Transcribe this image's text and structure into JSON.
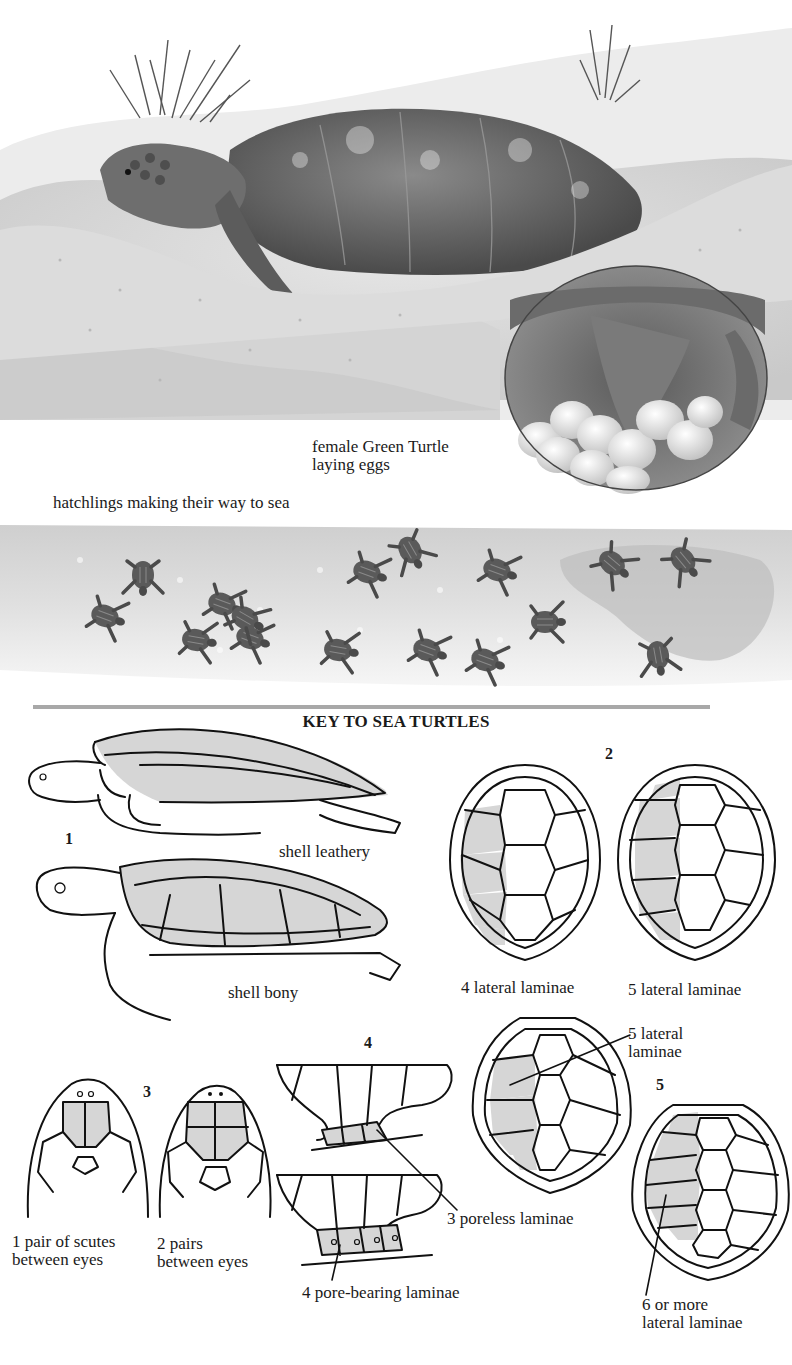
{
  "illustration_top": {
    "subject": "female Green Turtle nesting on sandy dune",
    "inset": "circular inset showing eggs being laid",
    "caption_line1": "female Green Turtle",
    "caption_line2": "laying eggs"
  },
  "illustration_hatchlings": {
    "caption": "hatchlings making their way to sea",
    "hatchling_count": 16
  },
  "divider": {
    "color": "#a8a8a8"
  },
  "key": {
    "title": "KEY TO SEA TURTLES",
    "accent_shade": "#d6d6d6",
    "sections": [
      {
        "number": "1",
        "labels": [
          "shell leathery",
          "shell bony"
        ]
      },
      {
        "number": "2",
        "labels": [
          "4 lateral laminae",
          "5 lateral laminae"
        ]
      },
      {
        "number": "3",
        "labels": [
          "1 pair of scutes between eyes",
          "2 pairs between eyes"
        ]
      },
      {
        "number": "4",
        "labels": [
          "3 poreless laminae",
          "4 pore-bearing laminae"
        ]
      },
      {
        "number": "5",
        "labels": [
          "5 lateral laminae",
          "6 or more lateral laminae"
        ]
      }
    ]
  },
  "labels": {
    "s1_num": "1",
    "s1_leathery": "shell leathery",
    "s1_bony": "shell bony",
    "s2_num": "2",
    "s2_left": "4 lateral laminae",
    "s2_right": "5 lateral laminae",
    "s3_num": "3",
    "s3_left_l1": "1 pair of scutes",
    "s3_left_l2": "between eyes",
    "s3_right_l1": "2 pairs",
    "s3_right_l2": "between eyes",
    "s4_num": "4",
    "s4_poreless": "3 poreless laminae",
    "s4_pore": "4 pore-bearing laminae",
    "s5_num": "5",
    "s5_top_l1": "5 lateral",
    "s5_top_l2": "laminae",
    "s5_bot_l1": "6 or more",
    "s5_bot_l2": "lateral laminae"
  }
}
